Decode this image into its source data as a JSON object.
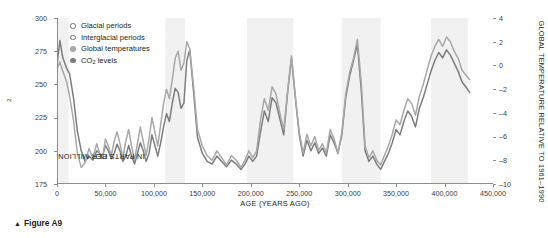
{
  "caption": {
    "marker": "▲",
    "text": "Figure A9"
  },
  "legend": {
    "items": [
      {
        "label": "Glacial periods",
        "symbol": "open-circle",
        "color": "#ffffff"
      },
      {
        "label": "Interglacial periods",
        "symbol": "open-circle",
        "color": "#f2f2f2"
      },
      {
        "label": "Global temperatures",
        "symbol": "filled-circle",
        "color": "#a8a8a8"
      },
      {
        "label": "CO2 levels",
        "label_main": "CO",
        "label_sub": "2",
        "label_tail": " levels",
        "symbol": "filled-circle",
        "color": "#7d7d7d"
      }
    ]
  },
  "chart_data": {
    "type": "line",
    "title": "",
    "xlabel": "AGE (YEARS AGO)",
    "ylabel": "CO2 IN PARTS PER MILLION",
    "ylabel_left_main": "CO",
    "ylabel_left_sub": "2",
    "ylabel_left_tail": " IN PARTS PER MILLION",
    "ylabel_right": "GLOBAL TEMPERATURE RELATIVE TO 1961–1990",
    "xlim": [
      0,
      450000
    ],
    "xticks": [
      0,
      50000,
      100000,
      150000,
      200000,
      250000,
      300000,
      350000,
      400000,
      450000
    ],
    "xticklabels": [
      "0",
      "50,000",
      "100,000",
      "150,000",
      "200,000",
      "250,000",
      "300,000",
      "350,000",
      "400,000",
      "450,000"
    ],
    "ylim_left": [
      175,
      300
    ],
    "yticks_left": [
      175,
      200,
      225,
      250,
      275,
      300
    ],
    "yticklabels_left": [
      "175",
      "200",
      "225",
      "250",
      "275",
      "300"
    ],
    "ylim_right": [
      -10,
      4
    ],
    "yticks_right": [
      -10,
      -8,
      -6,
      -4,
      -2,
      0,
      2,
      4
    ],
    "yticklabels_right": [
      "–10",
      "–8",
      "–6",
      "–4",
      "–2",
      "0",
      "2",
      "4"
    ],
    "grid": false,
    "legend_position": "top-left",
    "interglacial_bands": [
      {
        "start": 0,
        "end": 12000
      },
      {
        "start": 112000,
        "end": 132000
      },
      {
        "start": 196000,
        "end": 244000
      },
      {
        "start": 294000,
        "end": 334000
      },
      {
        "start": 386000,
        "end": 424000
      }
    ],
    "series": [
      {
        "name": "CO2 levels",
        "color": "#7d7d7d",
        "unit": "ppm",
        "axis": "left",
        "x": [
          0,
          3000,
          6000,
          10000,
          13000,
          17000,
          21000,
          25000,
          29000,
          33000,
          37000,
          41000,
          44000,
          47000,
          50000,
          53000,
          56000,
          59000,
          62000,
          65000,
          68000,
          71000,
          74000,
          77000,
          80000,
          83000,
          86000,
          89000,
          92000,
          95000,
          98000,
          101000,
          104000,
          107000,
          110000,
          113000,
          116000,
          119000,
          122000,
          125000,
          128000,
          131000,
          134000,
          137000,
          141000,
          145000,
          150000,
          155000,
          160000,
          165000,
          170000,
          175000,
          180000,
          185000,
          190000,
          194000,
          198000,
          202000,
          206000,
          210000,
          214000,
          218000,
          222000,
          226000,
          230000,
          234000,
          238000,
          242000,
          246000,
          250000,
          254000,
          258000,
          262000,
          266000,
          270000,
          274000,
          278000,
          282000,
          286000,
          290000,
          294000,
          298000,
          302000,
          306000,
          310000,
          314000,
          318000,
          322000,
          326000,
          330000,
          334000,
          338000,
          342000,
          346000,
          350000,
          354000,
          358000,
          362000,
          366000,
          370000,
          374000,
          378000,
          382000,
          386000,
          390000,
          394000,
          398000,
          402000,
          406000,
          410000,
          414000,
          418000,
          422000,
          426000
        ],
        "y": [
          265,
          283,
          270,
          262,
          258,
          240,
          215,
          200,
          192,
          196,
          193,
          200,
          198,
          196,
          204,
          200,
          194,
          198,
          205,
          200,
          192,
          196,
          204,
          196,
          190,
          198,
          206,
          200,
          192,
          198,
          212,
          204,
          196,
          206,
          218,
          228,
          222,
          236,
          247,
          244,
          232,
          236,
          268,
          276,
          244,
          210,
          198,
          192,
          190,
          196,
          192,
          188,
          193,
          190,
          186,
          190,
          196,
          192,
          196,
          214,
          230,
          222,
          240,
          236,
          224,
          212,
          244,
          270,
          240,
          212,
          196,
          208,
          200,
          206,
          198,
          202,
          196,
          212,
          206,
          198,
          212,
          240,
          256,
          268,
          280,
          246,
          200,
          192,
          196,
          190,
          186,
          192,
          198,
          206,
          216,
          212,
          222,
          230,
          226,
          218,
          232,
          240,
          250,
          260,
          268,
          274,
          270,
          276,
          272,
          266,
          260,
          252,
          248,
          244
        ]
      },
      {
        "name": "Global temperatures",
        "color": "#a8a8a8",
        "unit": "degC",
        "axis": "right",
        "x": [
          0,
          3000,
          6000,
          10000,
          13000,
          17000,
          21000,
          25000,
          29000,
          33000,
          37000,
          41000,
          44000,
          47000,
          50000,
          53000,
          56000,
          59000,
          62000,
          65000,
          68000,
          71000,
          74000,
          77000,
          80000,
          83000,
          86000,
          89000,
          92000,
          95000,
          98000,
          101000,
          104000,
          107000,
          110000,
          113000,
          116000,
          119000,
          122000,
          125000,
          128000,
          131000,
          134000,
          137000,
          141000,
          145000,
          150000,
          155000,
          160000,
          165000,
          170000,
          175000,
          180000,
          185000,
          190000,
          194000,
          198000,
          202000,
          206000,
          210000,
          214000,
          218000,
          222000,
          226000,
          230000,
          234000,
          238000,
          242000,
          246000,
          250000,
          254000,
          258000,
          262000,
          266000,
          270000,
          274000,
          278000,
          282000,
          286000,
          290000,
          294000,
          298000,
          302000,
          306000,
          310000,
          314000,
          318000,
          322000,
          326000,
          330000,
          334000,
          338000,
          342000,
          346000,
          350000,
          354000,
          358000,
          362000,
          366000,
          370000,
          374000,
          378000,
          382000,
          386000,
          390000,
          394000,
          398000,
          402000,
          406000,
          410000,
          414000,
          418000,
          422000,
          426000
        ],
        "y": [
          -0.3,
          0.3,
          -0.5,
          -1.4,
          -2.6,
          -4.6,
          -7.4,
          -8.6,
          -8.2,
          -7.0,
          -7.8,
          -6.6,
          -7.4,
          -7.8,
          -6.2,
          -6.8,
          -7.6,
          -6.4,
          -5.6,
          -6.6,
          -7.8,
          -6.4,
          -5.4,
          -6.8,
          -8.0,
          -6.6,
          -5.2,
          -6.4,
          -7.6,
          -6.2,
          -4.4,
          -5.6,
          -6.8,
          -5.0,
          -3.2,
          -2.0,
          -2.8,
          -1.2,
          0.6,
          1.2,
          -0.4,
          0.2,
          2.0,
          1.4,
          -1.8,
          -5.4,
          -6.8,
          -7.6,
          -8.0,
          -7.2,
          -7.8,
          -8.4,
          -7.6,
          -8.0,
          -8.6,
          -8.0,
          -7.2,
          -7.8,
          -7.2,
          -4.6,
          -2.8,
          -3.8,
          -1.8,
          -2.4,
          -4.0,
          -5.4,
          -2.2,
          0.8,
          -2.6,
          -5.6,
          -7.4,
          -5.8,
          -6.8,
          -6.0,
          -7.2,
          -6.6,
          -7.4,
          -5.4,
          -6.2,
          -7.4,
          -5.6,
          -2.4,
          -0.6,
          0.6,
          2.2,
          -1.4,
          -6.8,
          -7.8,
          -7.2,
          -8.0,
          -8.4,
          -7.6,
          -6.8,
          -5.8,
          -4.6,
          -5.0,
          -3.8,
          -2.8,
          -3.2,
          -4.2,
          -2.6,
          -1.6,
          -0.4,
          0.8,
          1.6,
          2.2,
          1.6,
          2.4,
          2.0,
          1.2,
          0.6,
          -0.4,
          -0.8,
          -1.2
        ]
      }
    ]
  }
}
